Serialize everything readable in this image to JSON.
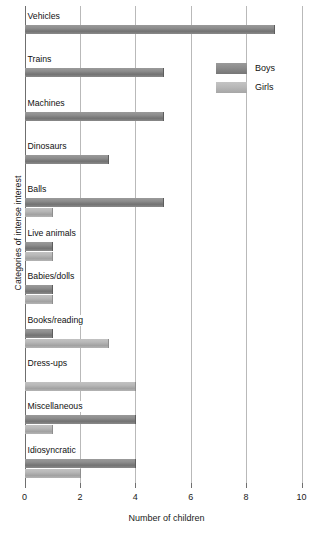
{
  "chart_data": {
    "type": "bar",
    "orientation": "horizontal",
    "title": "",
    "xlabel": "Number of children",
    "ylabel": "Categories of intense interest",
    "xlim": [
      0,
      10
    ],
    "xticks": [
      0,
      2,
      4,
      6,
      8,
      10
    ],
    "grid": true,
    "legend_position": "top-right",
    "categories": [
      "Vehicles",
      "Trains",
      "Machines",
      "Dinosaurs",
      "Balls",
      "Live animals",
      "Babies/dolls",
      "Books/reading",
      "Dress-ups",
      "Miscellaneous",
      "Idiosyncratic"
    ],
    "series": [
      {
        "name": "Boys",
        "color": "#8a8a8a",
        "values": [
          9,
          5,
          5,
          3,
          5,
          1,
          1,
          1,
          0,
          4,
          4
        ]
      },
      {
        "name": "Girls",
        "color": "#b8b8b8",
        "values": [
          0,
          0,
          0,
          0,
          1,
          1,
          1,
          3,
          4,
          1,
          2
        ]
      }
    ]
  },
  "legend": {
    "items": [
      {
        "label": "Boys"
      },
      {
        "label": "Girls"
      }
    ]
  }
}
